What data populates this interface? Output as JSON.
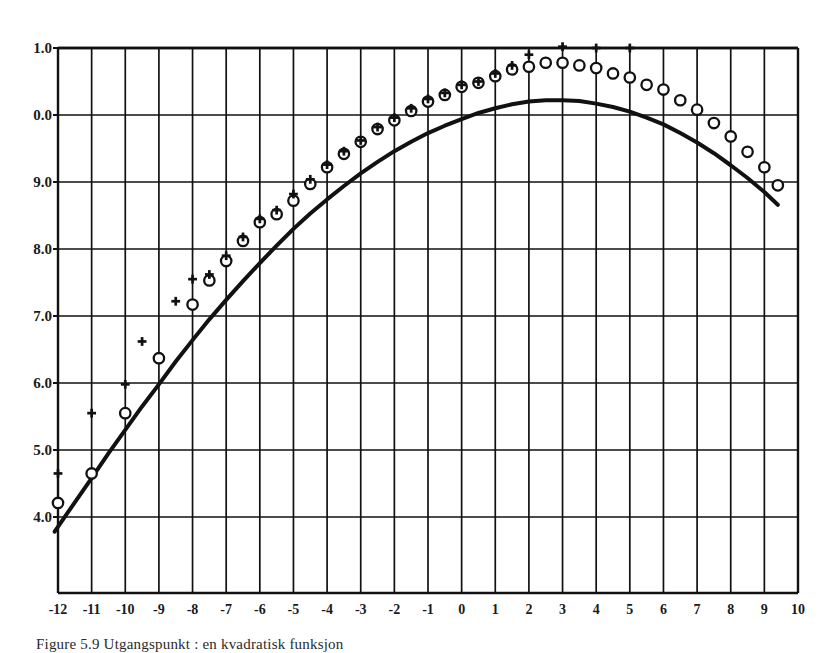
{
  "figure": {
    "caption": "Figure 5.9  Utgangspunkt : en kvadratisk funksjon"
  },
  "chart_data": {
    "type": "scatter",
    "title": "",
    "xlabel": "",
    "ylabel": "",
    "xlim": [
      -12,
      10
    ],
    "ylim": [
      3.0,
      11.0
    ],
    "xticks": [
      "-12",
      "-11",
      "-10",
      "-9",
      "-8",
      "-7",
      "-6",
      "-5",
      "-4",
      "-3",
      "-2",
      "-1",
      "0",
      "1",
      "2",
      "3",
      "4",
      "5",
      "6",
      "7",
      "8",
      "9",
      "10"
    ],
    "xtick_values": [
      -12,
      -11,
      -10,
      -9,
      -8,
      -7,
      -6,
      -5,
      -4,
      -3,
      -2,
      -1,
      0,
      1,
      2,
      3,
      4,
      5,
      6,
      7,
      8,
      9,
      10
    ],
    "yticks": [
      "4.0",
      "5.0",
      "6.0",
      "7.0",
      "8.0",
      "9.0",
      "0.0",
      "1.0"
    ],
    "ytick_values": [
      4,
      5,
      6,
      7,
      8,
      9,
      10,
      11
    ],
    "ytick_labels_full": [
      "4.0",
      "5.0",
      "6.0",
      "7.0",
      "8.0",
      "9.0",
      "10.0",
      "11.0"
    ],
    "grid": true,
    "grid_x_step": 1,
    "grid_y_step": 1,
    "legend": [],
    "legend_position": "none",
    "line_color": "#111111",
    "marker_color": "#111111",
    "series": [
      {
        "name": "fitted curve",
        "type": "line",
        "marker": "none",
        "x": [
          -12.1,
          -11.5,
          -11.0,
          -10.5,
          -10.0,
          -9.5,
          -9.0,
          -8.5,
          -8.0,
          -7.5,
          -7.0,
          -6.5,
          -6.0,
          -5.5,
          -5.0,
          -4.5,
          -4.0,
          -3.5,
          -3.0,
          -2.5,
          -2.0,
          -1.5,
          -1.0,
          -0.5,
          0.0,
          0.5,
          1.0,
          1.5,
          2.0,
          2.5,
          3.0,
          3.5,
          4.0,
          4.5,
          5.0,
          5.5,
          6.0,
          6.5,
          7.0,
          7.5,
          8.0,
          8.5,
          9.0,
          9.4
        ],
        "y": [
          3.78,
          4.22,
          4.58,
          4.95,
          5.3,
          5.65,
          5.98,
          6.32,
          6.64,
          6.95,
          7.24,
          7.52,
          7.79,
          8.05,
          8.3,
          8.53,
          8.74,
          8.94,
          9.13,
          9.3,
          9.46,
          9.6,
          9.73,
          9.84,
          9.94,
          10.03,
          10.1,
          10.16,
          10.2,
          10.22,
          10.22,
          10.21,
          10.17,
          10.12,
          10.05,
          9.96,
          9.86,
          9.73,
          9.59,
          9.43,
          9.25,
          9.06,
          8.85,
          8.66
        ]
      },
      {
        "name": "observed (circle)",
        "type": "scatter",
        "marker": "circle",
        "x": [
          -12.0,
          -11.0,
          -10.0,
          -9.0,
          -8.0,
          -7.5,
          -7.0,
          -6.5,
          -6.0,
          -5.5,
          -5.0,
          -4.5,
          -4.0,
          -3.5,
          -3.0,
          -2.5,
          -2.0,
          -1.5,
          -1.0,
          -0.5,
          0.0,
          0.5,
          1.0,
          1.5,
          2.0,
          2.5,
          3.0,
          3.5,
          4.0,
          4.5,
          5.0,
          5.5,
          6.0,
          6.5,
          7.0,
          7.5,
          8.0,
          8.5,
          9.0,
          9.4
        ],
        "y": [
          4.21,
          4.65,
          5.55,
          6.37,
          7.17,
          7.53,
          7.82,
          8.12,
          8.4,
          8.52,
          8.72,
          8.97,
          9.22,
          9.42,
          9.6,
          9.79,
          9.92,
          10.06,
          10.2,
          10.3,
          10.42,
          10.48,
          10.58,
          10.68,
          10.72,
          10.78,
          10.78,
          10.74,
          10.7,
          10.62,
          10.56,
          10.45,
          10.38,
          10.22,
          10.08,
          9.88,
          9.68,
          9.45,
          9.22,
          8.95
        ]
      },
      {
        "name": "observed (plus)",
        "type": "scatter",
        "marker": "plus",
        "x": [
          -12.0,
          -11.0,
          -10.0,
          -9.5,
          -8.5,
          -8.0,
          -7.5,
          -7.0,
          -6.5,
          -6.0,
          -5.5,
          -5.0,
          -4.5,
          -4.0,
          -3.5,
          -3.0,
          -2.5,
          -2.0,
          -1.5,
          -1.0,
          -0.5,
          0.0,
          0.5,
          1.0,
          1.5,
          2.0,
          3.0,
          4.0,
          5.0
        ],
        "y": [
          4.65,
          5.55,
          5.98,
          6.62,
          7.22,
          7.55,
          7.62,
          7.9,
          8.18,
          8.45,
          8.58,
          8.82,
          9.04,
          9.26,
          9.46,
          9.62,
          9.82,
          9.96,
          10.1,
          10.24,
          10.33,
          10.45,
          10.5,
          10.62,
          10.74,
          10.9,
          11.02,
          11.0,
          11.0
        ]
      }
    ]
  }
}
